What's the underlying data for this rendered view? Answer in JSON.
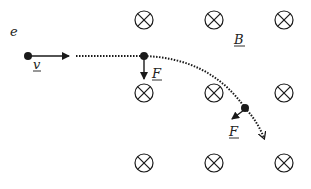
{
  "diagram": {
    "labels": {
      "electron": "e",
      "velocity": "v",
      "force1": "F",
      "force2": "F",
      "field": "B"
    },
    "field_symbol": "into-page (circled cross)",
    "field_grid": {
      "columns_x": [
        144,
        214,
        284
      ],
      "rows_y": [
        20,
        93,
        163
      ]
    },
    "colors": {
      "ink": "#1a1a1a",
      "background": "#ffffff"
    }
  }
}
